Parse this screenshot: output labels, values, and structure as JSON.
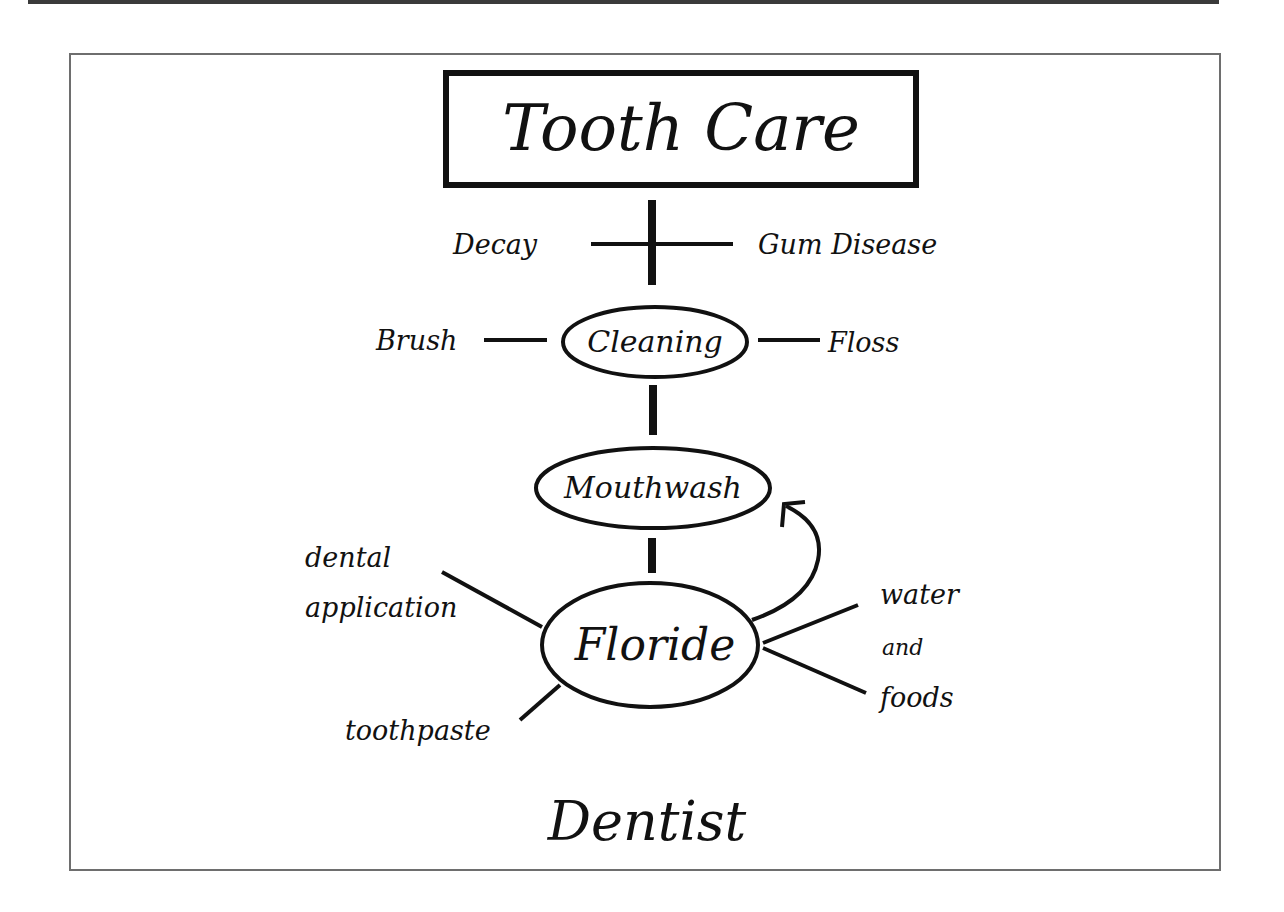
{
  "diagram": {
    "title": "Tooth Care",
    "problems": {
      "left": "Decay",
      "right": "Gum Disease"
    },
    "nodes": {
      "cleaning": {
        "label": "Cleaning",
        "left": "Brush",
        "right": "Floss"
      },
      "mouthwash": {
        "label": "Mouthwash"
      },
      "floride": {
        "label": "Floride",
        "upper_left_line1": "dental",
        "upper_left_line2": "application",
        "lower_left": "toothpaste",
        "right_line1": "water",
        "right_line2": "and",
        "right_line3": "foods"
      }
    },
    "footer": "Dentist",
    "colors": {
      "ink": "#111111",
      "frame": "#6e6e6e",
      "top_bar": "#3a3a3a",
      "background": "#ffffff"
    }
  }
}
